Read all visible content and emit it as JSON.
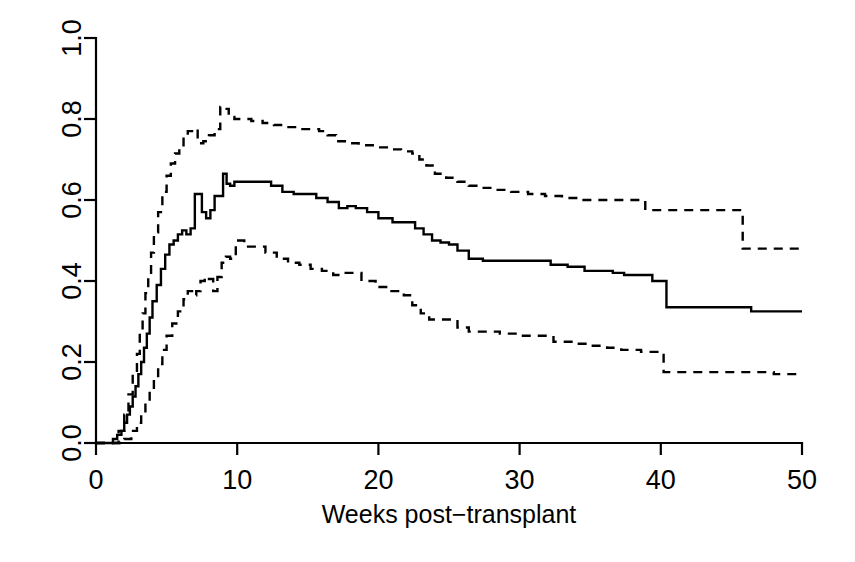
{
  "chart_data": {
    "type": "line",
    "title": "",
    "subtitle": "",
    "xlabel": "Weeks post−transplant",
    "ylabel": "",
    "xlim": [
      0,
      50
    ],
    "ylim": [
      0,
      1.0
    ],
    "xticks": [
      0,
      10,
      20,
      30,
      40,
      50
    ],
    "xtick_labels": [
      "0",
      "10",
      "20",
      "30",
      "40",
      "50"
    ],
    "yticks": [
      0.0,
      0.2,
      0.4,
      0.6,
      0.8,
      1.0
    ],
    "ytick_labels": [
      "0.0",
      "0.2",
      "0.4",
      "0.6",
      "0.8",
      "1.0"
    ],
    "ytick_label_rotation": -90,
    "grid": false,
    "legend": false,
    "legend_position": "none",
    "step_style": "post",
    "line_color": "#000000",
    "series": [
      {
        "name": "upper-confidence-band",
        "style": "dashed",
        "x": [
          0.0,
          1.0,
          1.6,
          2.0,
          2.3,
          2.6,
          2.9,
          3.1,
          3.3,
          3.5,
          3.7,
          3.9,
          4.1,
          4.4,
          4.7,
          5.0,
          5.3,
          5.6,
          5.9,
          6.2,
          6.5,
          6.8,
          7.2,
          7.6,
          8.0,
          8.4,
          8.8,
          9.1,
          9.4,
          9.8,
          10.4,
          11.0,
          11.8,
          12.6,
          13.4,
          14.2,
          15.0,
          15.8,
          16.4,
          17.0,
          17.8,
          18.6,
          19.6,
          20.6,
          21.6,
          22.4,
          22.9,
          23.4,
          24.0,
          24.8,
          25.6,
          26.4,
          27.2,
          28.2,
          29.4,
          30.6,
          31.8,
          33.0,
          34.2,
          35.4,
          36.6,
          37.6,
          38.4,
          38.9,
          39.6,
          41.0,
          43.0,
          45.0,
          45.8,
          47.0,
          49.0,
          50.0
        ],
        "y": [
          0.0,
          0.0,
          0.03,
          0.07,
          0.12,
          0.17,
          0.22,
          0.27,
          0.32,
          0.37,
          0.42,
          0.47,
          0.52,
          0.57,
          0.62,
          0.66,
          0.69,
          0.715,
          0.735,
          0.755,
          0.77,
          0.775,
          0.74,
          0.745,
          0.76,
          0.775,
          0.83,
          0.825,
          0.805,
          0.8,
          0.8,
          0.795,
          0.79,
          0.785,
          0.78,
          0.775,
          0.775,
          0.77,
          0.76,
          0.745,
          0.74,
          0.735,
          0.73,
          0.725,
          0.72,
          0.715,
          0.7,
          0.685,
          0.665,
          0.655,
          0.645,
          0.635,
          0.63,
          0.625,
          0.62,
          0.615,
          0.61,
          0.605,
          0.6,
          0.6,
          0.6,
          0.6,
          0.6,
          0.575,
          0.575,
          0.575,
          0.575,
          0.575,
          0.48,
          0.48,
          0.48,
          0.48
        ]
      },
      {
        "name": "estimate",
        "style": "solid",
        "x": [
          0.0,
          0.9,
          1.2,
          1.5,
          1.8,
          2.0,
          2.2,
          2.4,
          2.6,
          2.8,
          3.0,
          3.2,
          3.4,
          3.6,
          3.8,
          4.0,
          4.3,
          4.6,
          4.9,
          5.2,
          5.5,
          5.8,
          6.1,
          6.4,
          6.7,
          7.0,
          7.25,
          7.5,
          7.8,
          8.1,
          8.4,
          8.7,
          9.0,
          9.25,
          9.5,
          9.8,
          10.2,
          10.8,
          11.6,
          12.4,
          13.2,
          14.0,
          14.8,
          15.6,
          16.4,
          17.2,
          17.8,
          18.4,
          19.2,
          20.0,
          21.0,
          22.0,
          22.6,
          23.2,
          23.8,
          24.4,
          25.0,
          25.6,
          26.4,
          27.4,
          28.6,
          29.8,
          31.0,
          32.2,
          33.4,
          34.6,
          35.8,
          36.6,
          37.4,
          38.2,
          38.8,
          39.4,
          40.4,
          42.0,
          44.0,
          45.4,
          46.4,
          48.0,
          50.0
        ],
        "y": [
          0.0,
          0.0,
          0.01,
          0.02,
          0.03,
          0.05,
          0.07,
          0.09,
          0.115,
          0.14,
          0.17,
          0.2,
          0.235,
          0.27,
          0.31,
          0.35,
          0.39,
          0.43,
          0.465,
          0.49,
          0.5,
          0.515,
          0.525,
          0.515,
          0.53,
          0.615,
          0.615,
          0.57,
          0.555,
          0.575,
          0.61,
          0.61,
          0.665,
          0.64,
          0.635,
          0.645,
          0.645,
          0.645,
          0.645,
          0.635,
          0.62,
          0.615,
          0.615,
          0.605,
          0.595,
          0.58,
          0.585,
          0.58,
          0.57,
          0.555,
          0.545,
          0.545,
          0.53,
          0.515,
          0.5,
          0.495,
          0.49,
          0.475,
          0.455,
          0.45,
          0.45,
          0.45,
          0.45,
          0.44,
          0.435,
          0.425,
          0.425,
          0.42,
          0.415,
          0.415,
          0.415,
          0.4,
          0.335,
          0.335,
          0.335,
          0.335,
          0.325,
          0.325,
          0.325
        ]
      },
      {
        "name": "lower-confidence-band",
        "style": "dashed",
        "x": [
          0.0,
          1.3,
          2.0,
          2.5,
          2.9,
          3.2,
          3.5,
          3.8,
          4.1,
          4.4,
          4.7,
          5.0,
          5.4,
          5.8,
          6.2,
          6.5,
          6.8,
          7.1,
          7.4,
          7.7,
          8.0,
          8.3,
          8.6,
          8.9,
          9.2,
          9.5,
          9.9,
          10.5,
          11.2,
          12.0,
          12.8,
          13.6,
          14.4,
          15.2,
          16.0,
          16.8,
          17.4,
          18.0,
          18.8,
          19.8,
          20.8,
          21.8,
          22.4,
          23.0,
          23.6,
          24.2,
          24.8,
          25.6,
          26.4,
          27.4,
          28.6,
          29.8,
          31.0,
          32.4,
          33.8,
          35.0,
          36.2,
          37.2,
          38.0,
          38.6,
          39.2,
          40.2,
          42.0,
          44.0,
          46.0,
          48.0,
          50.0
        ],
        "y": [
          0.0,
          0.0,
          0.01,
          0.03,
          0.05,
          0.075,
          0.1,
          0.13,
          0.16,
          0.195,
          0.23,
          0.265,
          0.295,
          0.325,
          0.355,
          0.375,
          0.365,
          0.375,
          0.4,
          0.41,
          0.405,
          0.375,
          0.41,
          0.445,
          0.46,
          0.455,
          0.5,
          0.485,
          0.485,
          0.47,
          0.455,
          0.445,
          0.44,
          0.43,
          0.425,
          0.415,
          0.42,
          0.42,
          0.4,
          0.385,
          0.375,
          0.365,
          0.34,
          0.32,
          0.305,
          0.305,
          0.305,
          0.285,
          0.275,
          0.275,
          0.27,
          0.265,
          0.265,
          0.25,
          0.245,
          0.24,
          0.235,
          0.23,
          0.23,
          0.225,
          0.225,
          0.175,
          0.175,
          0.175,
          0.175,
          0.17,
          0.17
        ]
      }
    ]
  }
}
